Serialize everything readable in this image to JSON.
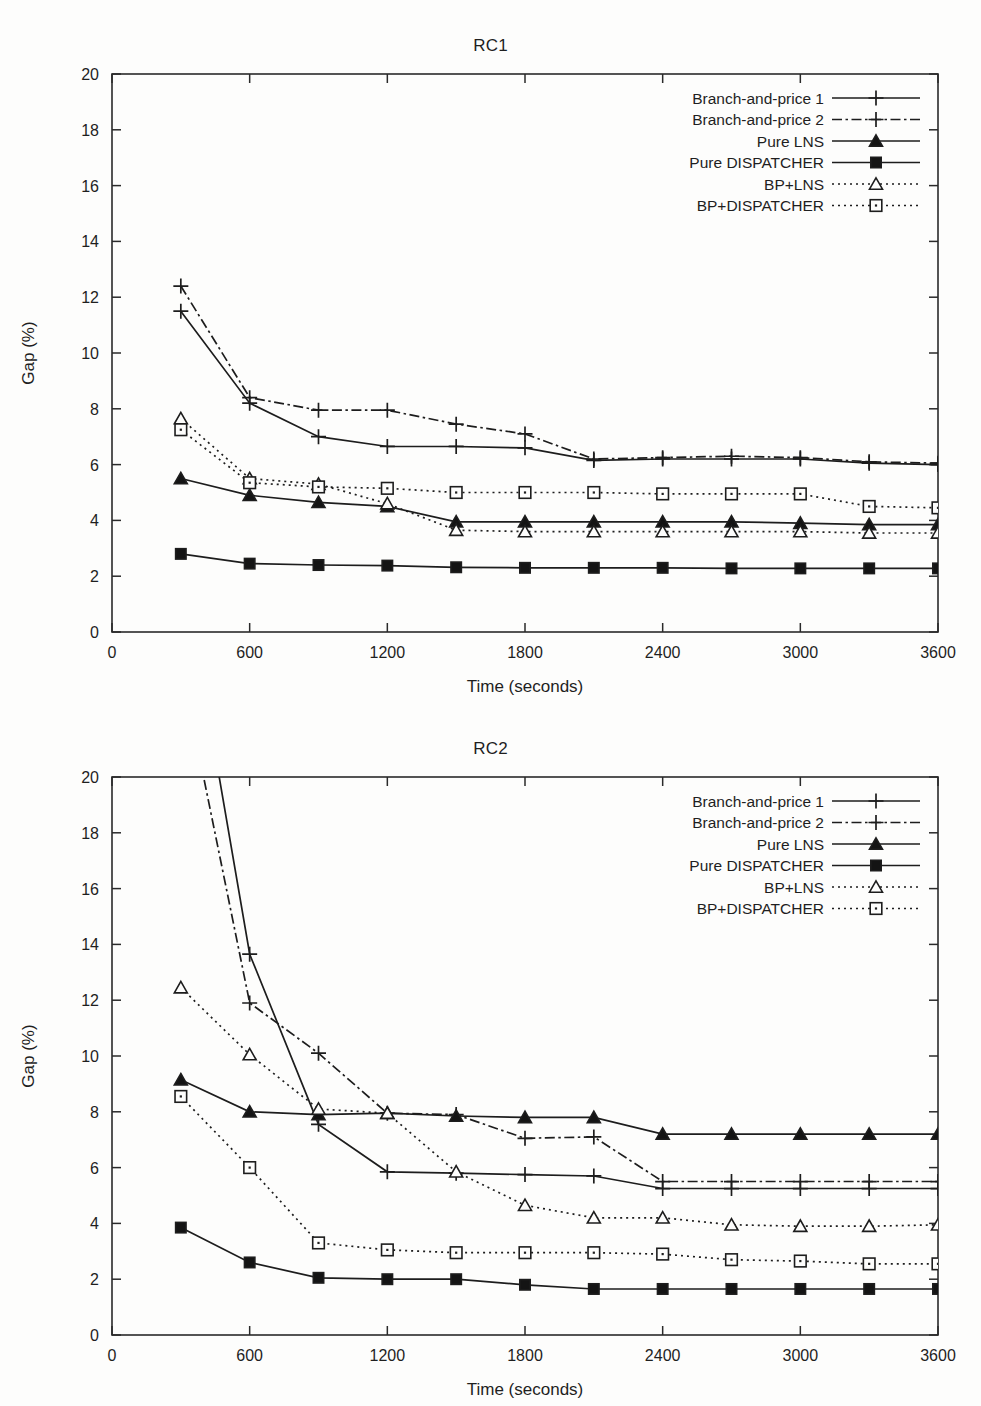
{
  "page": {
    "background": "#fdfdfc",
    "ink": "#1d1d1d"
  },
  "axis": {
    "xlabel": "Time (seconds)",
    "ylabel": "Gap (%)",
    "xticks": [
      "0",
      "600",
      "1200",
      "1800",
      "2400",
      "3000",
      "3600"
    ],
    "yticks": [
      "0",
      "2",
      "4",
      "6",
      "8",
      "10",
      "12",
      "14",
      "16",
      "18",
      "20"
    ],
    "xlim": [
      0,
      3600
    ],
    "ylim": [
      0,
      20
    ]
  },
  "legend": {
    "position": "top-right",
    "entries": [
      {
        "label": "Branch-and-price 1",
        "dash": "solid",
        "marker": "plus"
      },
      {
        "label": "Branch-and-price 2",
        "dash": "dashdot",
        "marker": "plus"
      },
      {
        "label": "Pure LNS",
        "dash": "solid",
        "marker": "triangle-filled"
      },
      {
        "label": "Pure DISPATCHER",
        "dash": "solid",
        "marker": "square-filled"
      },
      {
        "label": "BP+LNS",
        "dash": "dotted",
        "marker": "triangle-open"
      },
      {
        "label": "BP+DISPATCHER",
        "dash": "dotted",
        "marker": "square-open"
      }
    ]
  },
  "chart_data": [
    {
      "type": "line",
      "title": "RC1",
      "xlabel": "Time (seconds)",
      "ylabel": "Gap (%)",
      "xlim": [
        0,
        3600
      ],
      "ylim": [
        0,
        20
      ],
      "xticks": [
        0,
        600,
        1200,
        1800,
        2400,
        3000,
        3600
      ],
      "yticks": [
        0,
        2,
        4,
        6,
        8,
        10,
        12,
        14,
        16,
        18,
        20
      ],
      "grid": false,
      "legend_position": "top-right",
      "x": [
        300,
        600,
        900,
        1200,
        1500,
        1800,
        2100,
        2400,
        2700,
        3000,
        3300,
        3600
      ],
      "series": [
        {
          "name": "Branch-and-price 1",
          "dash": "solid",
          "marker": "plus",
          "values": [
            11.5,
            8.2,
            7.0,
            6.65,
            6.65,
            6.6,
            6.15,
            6.2,
            6.2,
            6.2,
            6.05,
            6.0
          ]
        },
        {
          "name": "Branch-and-price 2",
          "dash": "dashdot",
          "marker": "plus",
          "values": [
            12.4,
            8.4,
            7.95,
            7.95,
            7.45,
            7.1,
            6.2,
            6.25,
            6.3,
            6.25,
            6.1,
            6.05
          ]
        },
        {
          "name": "Pure LNS",
          "dash": "solid",
          "marker": "triangle-filled",
          "values": [
            5.5,
            4.9,
            4.65,
            4.5,
            3.95,
            3.95,
            3.95,
            3.95,
            3.95,
            3.9,
            3.85,
            3.85
          ]
        },
        {
          "name": "Pure DISPATCHER",
          "dash": "solid",
          "marker": "square-filled",
          "values": [
            2.8,
            2.45,
            2.4,
            2.38,
            2.32,
            2.3,
            2.3,
            2.3,
            2.28,
            2.28,
            2.28,
            2.28
          ]
        },
        {
          "name": "BP+LNS",
          "dash": "dotted",
          "marker": "triangle-open",
          "values": [
            7.65,
            5.5,
            5.3,
            4.6,
            3.65,
            3.6,
            3.6,
            3.6,
            3.6,
            3.6,
            3.55,
            3.55
          ]
        },
        {
          "name": "BP+DISPATCHER",
          "dash": "dotted",
          "marker": "square-open",
          "values": [
            7.25,
            5.35,
            5.2,
            5.15,
            5.0,
            5.0,
            5.0,
            4.95,
            4.95,
            4.95,
            4.5,
            4.45
          ]
        }
      ]
    },
    {
      "type": "line",
      "title": "RC2",
      "xlabel": "Time (seconds)",
      "ylabel": "Gap (%)",
      "xlim": [
        0,
        3600
      ],
      "ylim": [
        0,
        20
      ],
      "xticks": [
        0,
        600,
        1200,
        1800,
        2400,
        3000,
        3600
      ],
      "yticks": [
        0,
        2,
        4,
        6,
        8,
        10,
        12,
        14,
        16,
        18,
        20
      ],
      "grid": false,
      "legend_position": "top-right",
      "note": "Branch-and-price 1 and 2 start above the 20% axis maximum and are clipped at 300 s",
      "x": [
        300,
        600,
        900,
        1200,
        1500,
        1800,
        2100,
        2400,
        2700,
        3000,
        3300,
        3600
      ],
      "series": [
        {
          "name": "Branch-and-price 1",
          "dash": "solid",
          "marker": "plus",
          "values": [
            28.0,
            13.65,
            7.55,
            5.85,
            5.8,
            5.75,
            5.7,
            5.25,
            5.25,
            5.25,
            5.25,
            5.25
          ],
          "clipped_first": true
        },
        {
          "name": "Branch-and-price 2",
          "dash": "dashdot",
          "marker": "plus",
          "values": [
            24.0,
            11.9,
            10.1,
            7.95,
            7.9,
            7.05,
            7.1,
            5.5,
            5.5,
            5.5,
            5.5,
            5.5
          ],
          "clipped_first": true
        },
        {
          "name": "Pure LNS",
          "dash": "solid",
          "marker": "triangle-filled",
          "values": [
            9.15,
            8.0,
            7.9,
            7.95,
            7.85,
            7.8,
            7.8,
            7.2,
            7.2,
            7.2,
            7.2,
            7.2
          ]
        },
        {
          "name": "Pure DISPATCHER",
          "dash": "solid",
          "marker": "square-filled",
          "values": [
            3.85,
            2.6,
            2.05,
            2.0,
            2.0,
            1.8,
            1.65,
            1.65,
            1.65,
            1.65,
            1.65,
            1.65
          ]
        },
        {
          "name": "BP+LNS",
          "dash": "dotted",
          "marker": "triangle-open",
          "values": [
            12.45,
            10.05,
            8.1,
            7.95,
            5.85,
            4.65,
            4.2,
            4.2,
            3.95,
            3.9,
            3.9,
            3.95
          ]
        },
        {
          "name": "BP+DISPATCHER",
          "dash": "dotted",
          "marker": "square-open",
          "values": [
            8.55,
            6.0,
            3.3,
            3.05,
            2.95,
            2.95,
            2.95,
            2.9,
            2.7,
            2.65,
            2.55,
            2.55
          ]
        }
      ]
    }
  ]
}
